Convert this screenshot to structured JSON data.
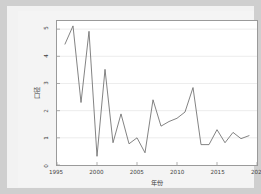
{
  "chart_data": {
    "type": "line",
    "title": "",
    "xlabel": "年份",
    "ylabel": "口径",
    "xlim": [
      1995,
      2020
    ],
    "ylim": [
      0,
      5.3
    ],
    "xticks": [
      "1995",
      "2000",
      "2005",
      "2010",
      "2015",
      "2020"
    ],
    "xtick_values": [
      1995,
      2000,
      2005,
      2010,
      2015,
      2020
    ],
    "yticks": [
      "0",
      "1",
      "2",
      "3",
      "4",
      "5"
    ],
    "ytick_values": [
      0,
      1,
      2,
      3,
      4,
      5
    ],
    "grid": true,
    "legend": null,
    "line_color": "#6b6b6b",
    "background_color": "#ffffff",
    "figure_background": "#f2f2f2",
    "outer_background": "#cfcfcf",
    "x": [
      1996,
      1997,
      1998,
      1999,
      2000,
      2001,
      2002,
      2003,
      2004,
      2005,
      2006,
      2007,
      2008,
      2009,
      2010,
      2011,
      2012,
      2013,
      2014,
      2015,
      2016,
      2017,
      2018,
      2019
    ],
    "values": [
      4.45,
      5.12,
      2.3,
      4.92,
      0.32,
      3.52,
      0.82,
      1.88,
      0.78,
      1.0,
      0.45,
      2.4,
      1.43,
      1.6,
      1.72,
      1.95,
      2.85,
      0.75,
      0.75,
      1.3,
      0.82,
      1.2,
      0.97,
      1.08
    ],
    "series": [
      {
        "name": "口径",
        "values": [
          4.45,
          5.12,
          2.3,
          4.92,
          0.32,
          3.52,
          0.82,
          1.88,
          0.78,
          1.0,
          0.45,
          2.4,
          1.43,
          1.6,
          1.72,
          1.95,
          2.85,
          0.75,
          0.75,
          1.3,
          0.82,
          1.2,
          0.97,
          1.08
        ]
      }
    ]
  }
}
